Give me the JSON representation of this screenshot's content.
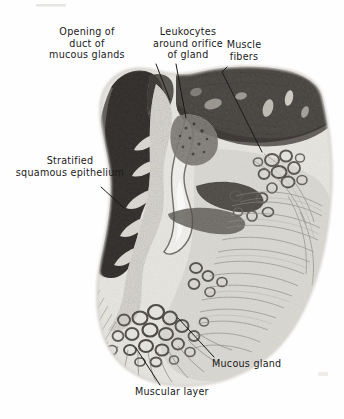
{
  "figure": {
    "kind": "histology-micrograph",
    "background_color": "#fefefe",
    "ink_color": "#1a1a1a"
  },
  "labels": [
    {
      "id": "opening-of-duct-of-mucous-glands",
      "text": "Opening of\nduct of\nmucous glands",
      "x": 22,
      "y": 26,
      "w": 130,
      "align": "center"
    },
    {
      "id": "leukocytes-around-orifice-of-gland",
      "text": "Leukocytes\naround orifice\nof gland",
      "x": 140,
      "y": 26,
      "w": 96,
      "align": "center"
    },
    {
      "id": "muscle-fibers",
      "text": "Muscle\nfibers",
      "x": 216,
      "y": 39,
      "w": 56,
      "align": "center"
    },
    {
      "id": "stratified-squamous-epithelium",
      "text": "Stratified\nsquamous epithelium",
      "x": 8,
      "y": 155,
      "w": 124,
      "align": "center"
    },
    {
      "id": "mucous-gland",
      "text": "Mucous gland",
      "x": 212,
      "y": 358,
      "w": 86,
      "align": "left"
    },
    {
      "id": "muscular-layer",
      "text": "Muscular layer",
      "x": 135,
      "y": 388,
      "w": 92,
      "align": "left"
    }
  ],
  "leader_lines": [
    {
      "id": "leader-duct-opening",
      "points": "156,64 170,100"
    },
    {
      "id": "leader-leukocytes",
      "points": "176,64 186,118"
    },
    {
      "id": "leader-muscle-fibers",
      "points": "227,67 222,72 262,152"
    },
    {
      "id": "leader-epithelium",
      "points": "101,187 124,208"
    },
    {
      "id": "leader-mucous-gland",
      "points": "214,357 178,318"
    },
    {
      "id": "leader-muscular-layer",
      "points": "160,385 136,348"
    }
  ],
  "regions": [
    {
      "id": "stratified-squamous-epithelium-region",
      "tone": "dark-gray",
      "hex": "#55524f"
    },
    {
      "id": "muscle-fiber-band-region",
      "tone": "medium-dark-gray",
      "hex": "#6e6b66"
    },
    {
      "id": "lamina-propria-region",
      "tone": "light-gray",
      "hex": "#d8d6d1"
    },
    {
      "id": "mucous-gland-acini-region",
      "tone": "mid-gray-rings",
      "hex": "#7d7a74"
    },
    {
      "id": "muscularis-striation-region",
      "tone": "pale-gray-striations",
      "hex": "#b9b6b0"
    }
  ]
}
